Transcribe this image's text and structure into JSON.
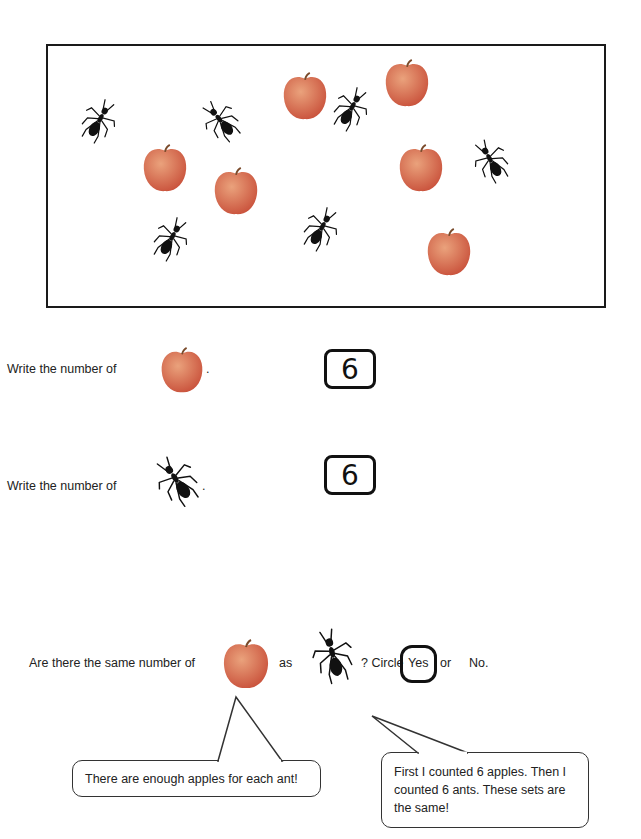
{
  "scene": {
    "apples": [
      {
        "x": 232,
        "y": 25
      },
      {
        "x": 334,
        "y": 12
      },
      {
        "x": 92,
        "y": 97
      },
      {
        "x": 163,
        "y": 120
      },
      {
        "x": 348,
        "y": 97
      },
      {
        "x": 376,
        "y": 181
      }
    ],
    "ants": [
      {
        "x": 28,
        "y": 52,
        "rot": 30
      },
      {
        "x": 150,
        "y": 52,
        "rot": -40
      },
      {
        "x": 280,
        "y": 40,
        "rot": 30
      },
      {
        "x": 420,
        "y": 92,
        "rot": -30
      },
      {
        "x": 100,
        "y": 170,
        "rot": 30
      },
      {
        "x": 250,
        "y": 160,
        "rot": 30
      }
    ],
    "apple_count": 6,
    "ant_count": 6
  },
  "questions": {
    "q1": {
      "label": "Write the number of",
      "object": "apple-icon",
      "punct": ".",
      "answer": "6"
    },
    "q2": {
      "label": "Write the number of",
      "object": "ant-icon",
      "punct": ".",
      "answer": "6"
    },
    "q3": {
      "prefix": "Are there the same number of",
      "middle": "as",
      "suffix": "? Circle",
      "option_yes": "Yes",
      "option_or": "or",
      "option_no": "No.",
      "selected": "Yes"
    }
  },
  "bubbles": {
    "left": "There are enough apples for each ant!",
    "right": "First I counted 6 apples.  Then I counted 6 ants.  These sets are the same!"
  },
  "colors": {
    "apple_dark": "#c9513b",
    "apple_light": "#eaa27c",
    "ant": "#111111",
    "ink": "#111111"
  }
}
